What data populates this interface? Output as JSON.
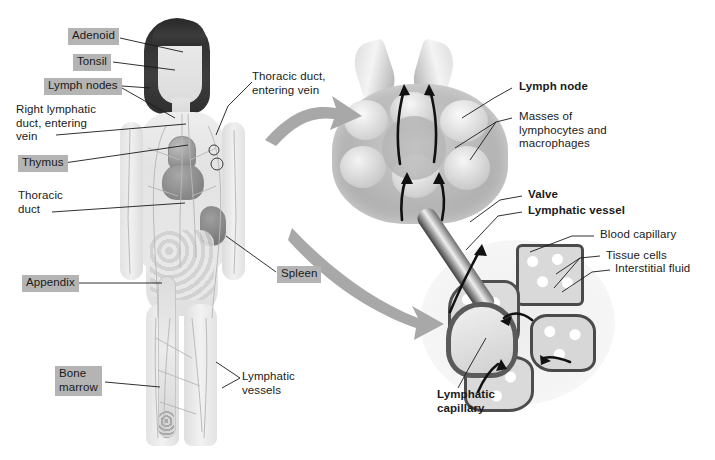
{
  "figure": {
    "background_color": "#ffffff",
    "label_box_color": "#b4b4b4",
    "leader_line_color": "#1a1a1a",
    "callout_arrow_color": "#a8a8a8",
    "flow_arrow_color": "#111111"
  },
  "body_labels": [
    {
      "id": "adenoid",
      "text": "Adenoid",
      "boxed": true,
      "bold": false,
      "align": "left"
    },
    {
      "id": "tonsil",
      "text": "Tonsil",
      "boxed": true,
      "bold": false,
      "align": "left"
    },
    {
      "id": "lymph-nodes",
      "text": "Lymph nodes",
      "boxed": true,
      "bold": false,
      "align": "left"
    },
    {
      "id": "right-duct",
      "text": "Right lymphatic\nduct, entering\nvein",
      "boxed": false,
      "bold": false,
      "align": "left"
    },
    {
      "id": "thymus",
      "text": "Thymus",
      "boxed": true,
      "bold": false,
      "align": "left"
    },
    {
      "id": "thoracic-duct",
      "text": "Thoracic\nduct",
      "boxed": false,
      "bold": false,
      "align": "left"
    },
    {
      "id": "appendix",
      "text": "Appendix",
      "boxed": true,
      "bold": false,
      "align": "left"
    },
    {
      "id": "bone-marrow",
      "text": "Bone\nmarrow",
      "boxed": true,
      "bold": false,
      "align": "left"
    },
    {
      "id": "thoracic-vein",
      "text": "Thoracic duct,\nentering vein",
      "boxed": false,
      "bold": false,
      "align": "left"
    },
    {
      "id": "spleen",
      "text": "Spleen",
      "boxed": true,
      "bold": false,
      "align": "left"
    },
    {
      "id": "lymph-vessels",
      "text": "Lymphatic\nvessels",
      "boxed": false,
      "bold": false,
      "align": "left"
    }
  ],
  "node_labels": [
    {
      "id": "lymph-node",
      "text": "Lymph node",
      "bold": true
    },
    {
      "id": "masses",
      "text": "Masses of\nlymphocytes and\nmacrophages",
      "bold": false
    },
    {
      "id": "valve",
      "text": "Valve",
      "bold": true
    },
    {
      "id": "lymphatic-vessel",
      "text": "Lymphatic vessel",
      "bold": true
    }
  ],
  "capillary_labels": [
    {
      "id": "blood-capillary",
      "text": "Blood capillary",
      "bold": false
    },
    {
      "id": "tissue-cells",
      "text": "Tissue cells",
      "bold": false
    },
    {
      "id": "interstitial-fluid",
      "text": "Interstitial fluid",
      "bold": false
    },
    {
      "id": "lymphatic-capillary",
      "text": "Lymphatic\ncapillary",
      "bold": true
    }
  ],
  "callouts": [
    {
      "id": "callout-to-node",
      "from": "upper body / lymph node",
      "to": "lymph node cross-section"
    },
    {
      "id": "callout-to-capillary",
      "from": "trunk",
      "to": "lymphatic capillary bed"
    }
  ]
}
